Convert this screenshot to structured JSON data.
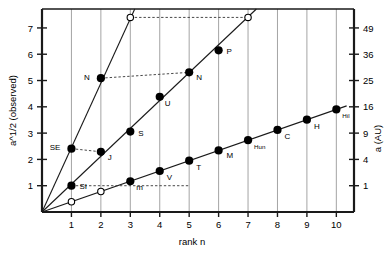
{
  "chart_data": {
    "type": "scatter",
    "title": "",
    "xlabel": "rank n",
    "ylabel": "a^1/2 (observed)",
    "y2label": "a (AU)",
    "xlim": [
      0,
      10.6
    ],
    "ylim": [
      0,
      7.72
    ],
    "grid": "vertical gridlines at every integer rank",
    "legend": "none",
    "xticks": [
      1,
      2,
      3,
      4,
      5,
      6,
      7,
      8,
      9,
      10
    ],
    "yticks": [
      1,
      2,
      3,
      4,
      5,
      6,
      7
    ],
    "y2ticks": [
      {
        "label": "1",
        "value": 1
      },
      {
        "label": "4",
        "value": 2
      },
      {
        "label": "9",
        "value": 3
      },
      {
        "label": "16",
        "value": 4
      },
      {
        "label": "25",
        "value": 5
      },
      {
        "label": "36",
        "value": 6
      },
      {
        "label": "49",
        "value": 7
      }
    ],
    "series": [
      {
        "name": "inner-system line (terrestrial planets)",
        "slope": 0.39,
        "points": [
          {
            "x": 1,
            "y": 0.39,
            "label": "",
            "filled": false
          },
          {
            "x": 2,
            "y": 0.78,
            "label": "",
            "filled": false
          },
          {
            "x": 3,
            "y": 1.17,
            "label": "m",
            "filled": true
          },
          {
            "x": 4,
            "y": 1.56,
            "label": "V",
            "filled": true
          },
          {
            "x": 5,
            "y": 1.95,
            "label": "T",
            "filled": true
          },
          {
            "x": 6,
            "y": 2.34,
            "label": "M",
            "filled": true
          },
          {
            "x": 7,
            "y": 2.73,
            "label": "Hun",
            "filled": true
          },
          {
            "x": 8,
            "y": 3.12,
            "label": "C",
            "filled": true
          },
          {
            "x": 9,
            "y": 3.51,
            "label": "H",
            "filled": true
          },
          {
            "x": 10,
            "y": 3.9,
            "label": "Hil",
            "filled": true
          }
        ]
      },
      {
        "name": "outer-system line (giant planets)",
        "slope": 1.06,
        "points": [
          {
            "x": 1,
            "y": 1.0,
            "label": "SI",
            "filled": true
          },
          {
            "x": 2,
            "y": 2.29,
            "label": "J",
            "filled": true
          },
          {
            "x": 3,
            "y": 3.06,
            "label": "S",
            "filled": true
          },
          {
            "x": 4,
            "y": 4.38,
            "label": "U",
            "filled": true
          },
          {
            "x": 5,
            "y": 5.31,
            "label": "N",
            "filled": true
          },
          {
            "x": 6,
            "y": 6.15,
            "label": "P",
            "filled": true
          },
          {
            "x": 7,
            "y": 7.4,
            "label": "",
            "filled": false
          }
        ]
      },
      {
        "name": "steep line (satellite system)",
        "slope": 2.45,
        "points": [
          {
            "x": 1,
            "y": 2.41,
            "label": "SE",
            "filled": true
          },
          {
            "x": 2,
            "y": 5.09,
            "label": "N",
            "filled": true
          },
          {
            "x": 3,
            "y": 7.4,
            "label": "",
            "filled": false
          }
        ]
      }
    ],
    "annotations": [
      {
        "type": "dashed-connector",
        "from": {
          "x": 1,
          "y": 2.41
        },
        "to": {
          "x": 2,
          "y": 2.29
        }
      },
      {
        "type": "dashed-connector",
        "from": {
          "x": 1,
          "y": 1.0
        },
        "to": {
          "x": 5,
          "y": 1.0
        }
      },
      {
        "type": "dashed-connector",
        "from": {
          "x": 2,
          "y": 5.09
        },
        "to": {
          "x": 5,
          "y": 5.31
        }
      },
      {
        "type": "dashed-connector",
        "from": {
          "x": 3,
          "y": 7.4
        },
        "to": {
          "x": 7,
          "y": 7.4
        }
      }
    ]
  },
  "colors": {
    "axis": "#1a1a1a",
    "grid": "#9a9a9a",
    "marker": "#000000",
    "dashed": "#333333",
    "background": "#ffffff"
  }
}
